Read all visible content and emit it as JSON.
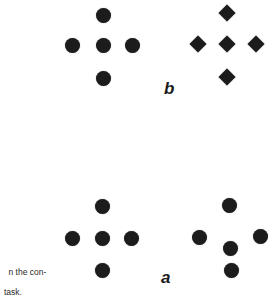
{
  "figure": {
    "colors": {
      "background": "#ffffff",
      "marker": "#1c1c1c",
      "text": "#2a2a2a"
    },
    "panels": [
      {
        "label": "b",
        "label_position": {
          "x": 164,
          "y": 80
        },
        "arrangements": [
          {
            "name": "cross-of-circles",
            "shape": "circle",
            "points": [
              {
                "x": 103,
                "y": 15
              },
              {
                "x": 72,
                "y": 45
              },
              {
                "x": 103,
                "y": 45
              },
              {
                "x": 132,
                "y": 45
              },
              {
                "x": 103,
                "y": 78
              }
            ]
          },
          {
            "name": "cross-of-diamonds",
            "shape": "diamond",
            "points": [
              {
                "x": 227,
                "y": 13
              },
              {
                "x": 198,
                "y": 44
              },
              {
                "x": 227,
                "y": 44
              },
              {
                "x": 256,
                "y": 44
              },
              {
                "x": 227,
                "y": 77
              }
            ]
          }
        ]
      },
      {
        "label": "a",
        "label_position": {
          "x": 161,
          "y": 269
        },
        "arrangements": [
          {
            "name": "cross-of-circles",
            "shape": "circle",
            "points": [
              {
                "x": 102,
                "y": 206
              },
              {
                "x": 72,
                "y": 238
              },
              {
                "x": 102,
                "y": 238
              },
              {
                "x": 131,
                "y": 238
              },
              {
                "x": 102,
                "y": 270
              }
            ]
          },
          {
            "name": "displaced-circles",
            "shape": "circle",
            "points": [
              {
                "x": 229,
                "y": 205
              },
              {
                "x": 199,
                "y": 237
              },
              {
                "x": 260,
                "y": 236
              },
              {
                "x": 230,
                "y": 248
              },
              {
                "x": 231,
                "y": 270
              }
            ]
          }
        ]
      }
    ],
    "caption": {
      "line1": "n the con-",
      "line2": "task."
    }
  }
}
